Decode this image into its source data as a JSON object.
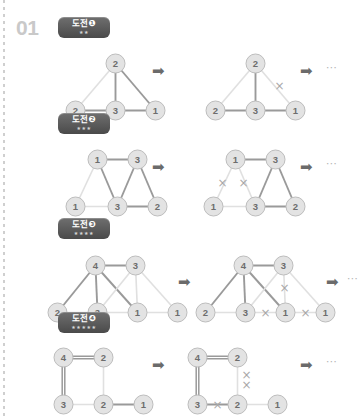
{
  "page": {
    "problem_number": "01",
    "binding_edge": "dotted-left-margin"
  },
  "symbols": {
    "arrow": "➡",
    "ellipsis": "⋯",
    "star": "★",
    "cross": "×"
  },
  "colors": {
    "node_fill": "#e3e3e3",
    "node_stroke": "#bdbdbd",
    "node_text": "#6d6d6d",
    "edge_dark": "#9a9a9a",
    "edge_light": "#e0e0e0",
    "badge_dark": "#4a4a4a",
    "arrow": "#6b6b6b",
    "problem_number": "#c9c9c9"
  },
  "sections": [
    {
      "id": "challenge-1",
      "badge_label": "도전❶",
      "badge_stars": "★★",
      "difficulty": 2,
      "before": {
        "nodes": [
          {
            "id": "t",
            "label": "2",
            "x": 50,
            "y": 8
          },
          {
            "id": "b1",
            "label": "2",
            "x": 10,
            "y": 55
          },
          {
            "id": "b2",
            "label": "3",
            "x": 50,
            "y": 55
          },
          {
            "id": "b3",
            "label": "1",
            "x": 90,
            "y": 55
          }
        ],
        "edges": [
          {
            "from": "t",
            "to": "b1",
            "weight": "light"
          },
          {
            "from": "t",
            "to": "b2",
            "weight": "dark"
          },
          {
            "from": "t",
            "to": "b3",
            "weight": "dark"
          },
          {
            "from": "b1",
            "to": "b2",
            "weight": "dark"
          },
          {
            "from": "b2",
            "to": "b3",
            "weight": "dark"
          }
        ],
        "crosses": []
      },
      "after": {
        "nodes": [
          {
            "id": "t",
            "label": "2",
            "x": 50,
            "y": 8
          },
          {
            "id": "b1",
            "label": "2",
            "x": 10,
            "y": 55
          },
          {
            "id": "b2",
            "label": "3",
            "x": 50,
            "y": 55
          },
          {
            "id": "b3",
            "label": "1",
            "x": 90,
            "y": 55
          }
        ],
        "edges": [
          {
            "from": "t",
            "to": "b1",
            "weight": "light"
          },
          {
            "from": "t",
            "to": "b2",
            "weight": "dark"
          },
          {
            "from": "t",
            "to": "b3",
            "weight": "light"
          },
          {
            "from": "b1",
            "to": "b2",
            "weight": "dark"
          },
          {
            "from": "b2",
            "to": "b3",
            "weight": "dark"
          }
        ],
        "crosses": [
          {
            "x": 74,
            "y": 30
          }
        ]
      }
    },
    {
      "id": "challenge-2",
      "badge_label": "도전❷",
      "badge_stars": "★★★",
      "difficulty": 3,
      "before": {
        "nodes": [
          {
            "id": "t1",
            "label": "1",
            "x": 30,
            "y": 8
          },
          {
            "id": "t2",
            "label": "3",
            "x": 70,
            "y": 8
          },
          {
            "id": "b1",
            "label": "1",
            "x": 8,
            "y": 55
          },
          {
            "id": "b2",
            "label": "3",
            "x": 50,
            "y": 55
          },
          {
            "id": "b3",
            "label": "2",
            "x": 90,
            "y": 55
          }
        ],
        "edges": [
          {
            "from": "t1",
            "to": "t2",
            "weight": "dark"
          },
          {
            "from": "t1",
            "to": "b1",
            "weight": "light"
          },
          {
            "from": "t1",
            "to": "b2",
            "weight": "dark"
          },
          {
            "from": "t2",
            "to": "b2",
            "weight": "dark"
          },
          {
            "from": "t2",
            "to": "b3",
            "weight": "dark"
          },
          {
            "from": "b1",
            "to": "b2",
            "weight": "light"
          },
          {
            "from": "b2",
            "to": "b3",
            "weight": "dark"
          }
        ],
        "crosses": []
      },
      "after": {
        "nodes": [
          {
            "id": "t1",
            "label": "1",
            "x": 30,
            "y": 8
          },
          {
            "id": "t2",
            "label": "3",
            "x": 70,
            "y": 8
          },
          {
            "id": "b1",
            "label": "1",
            "x": 8,
            "y": 55
          },
          {
            "id": "b2",
            "label": "3",
            "x": 50,
            "y": 55
          },
          {
            "id": "b3",
            "label": "2",
            "x": 90,
            "y": 55
          }
        ],
        "edges": [
          {
            "from": "t1",
            "to": "t2",
            "weight": "dark"
          },
          {
            "from": "t1",
            "to": "b1",
            "weight": "light"
          },
          {
            "from": "t1",
            "to": "b2",
            "weight": "light"
          },
          {
            "from": "t2",
            "to": "b2",
            "weight": "dark"
          },
          {
            "from": "t2",
            "to": "b3",
            "weight": "dark"
          },
          {
            "from": "b1",
            "to": "b2",
            "weight": "light"
          },
          {
            "from": "b2",
            "to": "b3",
            "weight": "dark"
          }
        ],
        "crosses": [
          {
            "x": 17,
            "y": 31
          },
          {
            "x": 38,
            "y": 31
          }
        ]
      }
    },
    {
      "id": "challenge-3",
      "badge_label": "도전❸",
      "badge_stars": "★★★★",
      "difficulty": 4,
      "before": {
        "nodes": [
          {
            "id": "t1",
            "label": "4",
            "x": 38,
            "y": 8
          },
          {
            "id": "t2",
            "label": "3",
            "x": 78,
            "y": 8
          },
          {
            "id": "b1",
            "label": "2",
            "x": 0,
            "y": 55
          },
          {
            "id": "b2",
            "label": "3",
            "x": 40,
            "y": 55
          },
          {
            "id": "b3",
            "label": "1",
            "x": 80,
            "y": 55
          },
          {
            "id": "b4",
            "label": "1",
            "x": 120,
            "y": 55
          }
        ],
        "edges": [
          {
            "from": "t1",
            "to": "t2",
            "weight": "dark"
          },
          {
            "from": "t1",
            "to": "b1",
            "weight": "dark"
          },
          {
            "from": "t1",
            "to": "b2",
            "weight": "dark"
          },
          {
            "from": "t1",
            "to": "b3",
            "weight": "dark"
          },
          {
            "from": "t2",
            "to": "b2",
            "weight": "light"
          },
          {
            "from": "t2",
            "to": "b3",
            "weight": "light"
          },
          {
            "from": "t2",
            "to": "b4",
            "weight": "light"
          },
          {
            "from": "b1",
            "to": "b2",
            "weight": "light"
          },
          {
            "from": "b2",
            "to": "b3",
            "weight": "light"
          },
          {
            "from": "b3",
            "to": "b4",
            "weight": "light"
          }
        ],
        "crosses": []
      },
      "after": {
        "nodes": [
          {
            "id": "t1",
            "label": "4",
            "x": 38,
            "y": 8
          },
          {
            "id": "t2",
            "label": "3",
            "x": 78,
            "y": 8
          },
          {
            "id": "b1",
            "label": "2",
            "x": 0,
            "y": 55
          },
          {
            "id": "b2",
            "label": "3",
            "x": 40,
            "y": 55
          },
          {
            "id": "b3",
            "label": "1",
            "x": 80,
            "y": 55
          },
          {
            "id": "b4",
            "label": "1",
            "x": 120,
            "y": 55
          }
        ],
        "edges": [
          {
            "from": "t1",
            "to": "t2",
            "weight": "dark"
          },
          {
            "from": "t1",
            "to": "b1",
            "weight": "dark"
          },
          {
            "from": "t1",
            "to": "b2",
            "weight": "dark"
          },
          {
            "from": "t1",
            "to": "b3",
            "weight": "dark"
          },
          {
            "from": "t2",
            "to": "b2",
            "weight": "light"
          },
          {
            "from": "t2",
            "to": "b3",
            "weight": "light"
          },
          {
            "from": "t2",
            "to": "b4",
            "weight": "light"
          },
          {
            "from": "b1",
            "to": "b2",
            "weight": "light"
          },
          {
            "from": "b2",
            "to": "b3",
            "weight": "light"
          },
          {
            "from": "b3",
            "to": "b4",
            "weight": "light"
          }
        ],
        "crosses": [
          {
            "x": 79,
            "y": 30
          },
          {
            "x": 60,
            "y": 55
          },
          {
            "x": 100,
            "y": 55
          }
        ]
      }
    },
    {
      "id": "challenge-4",
      "badge_label": "도전❹",
      "badge_stars": "★★★★★",
      "difficulty": 5,
      "before": {
        "nodes": [
          {
            "id": "t1",
            "label": "4",
            "x": 8,
            "y": 8
          },
          {
            "id": "t2",
            "label": "2",
            "x": 48,
            "y": 8
          },
          {
            "id": "b1",
            "label": "3",
            "x": 8,
            "y": 55
          },
          {
            "id": "b2",
            "label": "2",
            "x": 48,
            "y": 55
          },
          {
            "id": "b3",
            "label": "1",
            "x": 88,
            "y": 55
          }
        ],
        "edges": [
          {
            "from": "t1",
            "to": "t2",
            "weight": "double"
          },
          {
            "from": "t1",
            "to": "b1",
            "weight": "double"
          },
          {
            "from": "t2",
            "to": "b2",
            "weight": "light"
          },
          {
            "from": "b1",
            "to": "b2",
            "weight": "light"
          },
          {
            "from": "b2",
            "to": "b3",
            "weight": "dark"
          }
        ],
        "crosses": []
      },
      "after": {
        "nodes": [
          {
            "id": "t1",
            "label": "4",
            "x": 8,
            "y": 8
          },
          {
            "id": "t2",
            "label": "2",
            "x": 48,
            "y": 8
          },
          {
            "id": "b1",
            "label": "3",
            "x": 8,
            "y": 55
          },
          {
            "id": "b2",
            "label": "2",
            "x": 48,
            "y": 55
          },
          {
            "id": "b3",
            "label": "1",
            "x": 88,
            "y": 55
          }
        ],
        "edges": [
          {
            "from": "t1",
            "to": "t2",
            "weight": "double"
          },
          {
            "from": "t1",
            "to": "b1",
            "weight": "double"
          },
          {
            "from": "t2",
            "to": "b2",
            "weight": "light"
          },
          {
            "from": "b1",
            "to": "b2",
            "weight": "dark"
          },
          {
            "from": "b2",
            "to": "b3",
            "weight": "light"
          }
        ],
        "crosses": [
          {
            "x": 57,
            "y": 25
          },
          {
            "x": 57,
            "y": 35
          },
          {
            "x": 28,
            "y": 55
          }
        ]
      }
    }
  ]
}
